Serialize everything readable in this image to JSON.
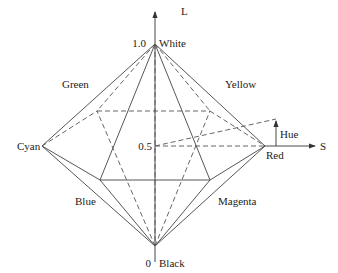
{
  "diagram": {
    "axes": {
      "vertical": {
        "label": "L",
        "top_tick": "1.0",
        "mid_tick": "0.5",
        "bottom_tick": "0"
      },
      "horizontal": {
        "label": "S"
      }
    },
    "vertices": {
      "top": "White",
      "bottom": "Black",
      "left": "Cyan",
      "right": "Red",
      "back_left": "Green",
      "back_right": "Yellow",
      "front_left": "Blue",
      "front_right": "Magenta"
    },
    "angle_label": "Hue",
    "colors": {
      "line": "#444444",
      "text": "#222222",
      "background": "#ffffff"
    }
  }
}
